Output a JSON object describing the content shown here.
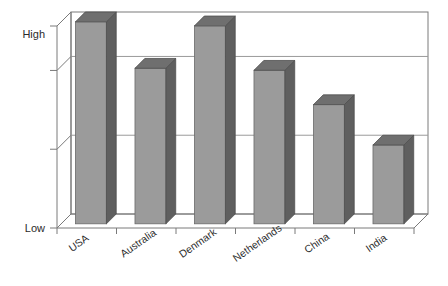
{
  "chart_data": {
    "type": "bar",
    "title": "",
    "subtitle": "",
    "xlabel": "",
    "ylabel": "",
    "categories": [
      "USA",
      "Australia",
      "Denmark",
      "Netherlands",
      "China",
      "India"
    ],
    "values": [
      100,
      77,
      98,
      76,
      59,
      39
    ],
    "ylim": [
      0,
      100
    ],
    "ytick_values": [
      0,
      100
    ],
    "ytick_labels": [
      "Low",
      "High"
    ],
    "gridlines": [
      39,
      78
    ],
    "grid": true,
    "legend": null,
    "legend_position": "none",
    "annotations": [],
    "style": {
      "three_d": true,
      "bar_front_color": "#9b9b9b",
      "bar_side_color": "#5f5f5f",
      "bar_top_color": "#6f6f6f",
      "axis_color": "#7a7a7a",
      "grid_color": "#9a9a9a",
      "plot_background": "#ffffff",
      "page_background": "#ffffff",
      "label_color": "#2b2b2b",
      "category_label_rotation": -35
    }
  },
  "axis": {
    "y_high_label": "High",
    "y_low_label": "Low"
  }
}
